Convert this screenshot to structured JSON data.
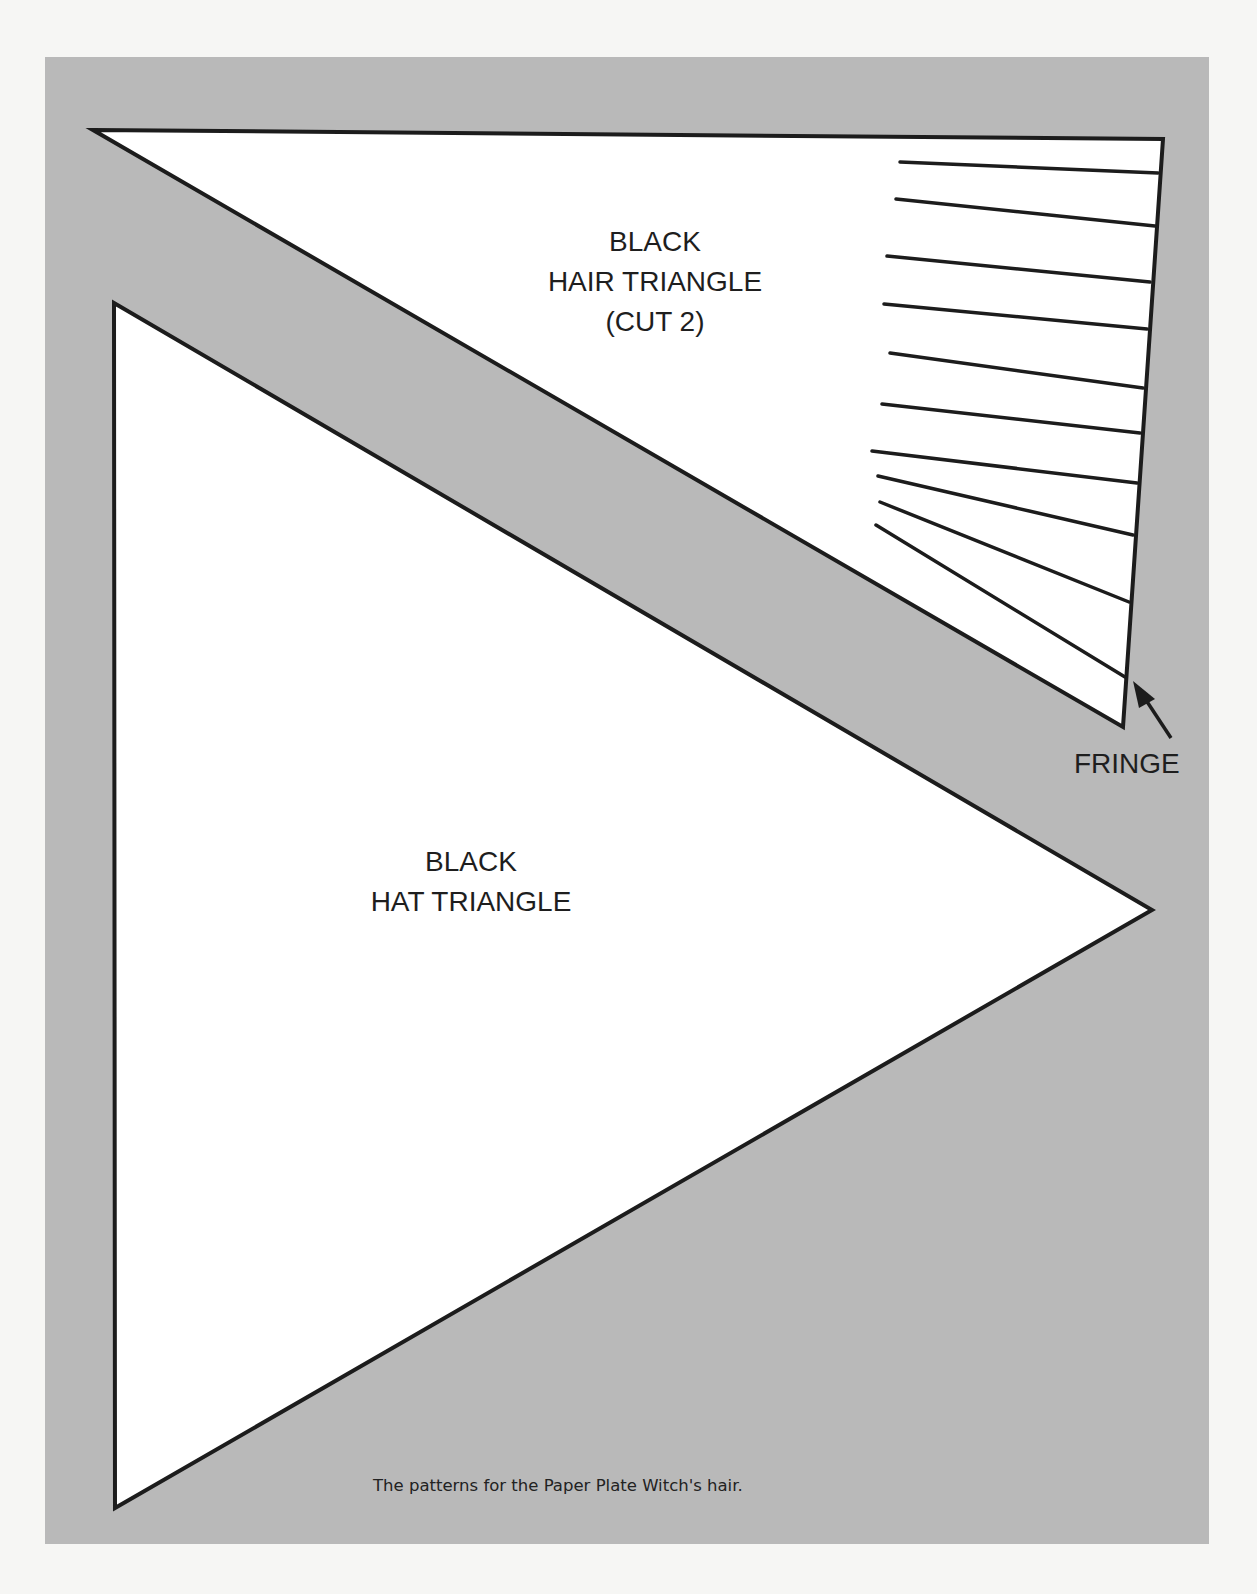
{
  "page": {
    "background_color": "#f6f6f4",
    "panel_color": "#b9b9b9",
    "line_color": "#1c1c1c"
  },
  "hair_triangle": {
    "label_lines": [
      "BLACK",
      "HAIR TRIANGLE",
      "(CUT 2)"
    ],
    "vertices": [
      [
        93,
        130
      ],
      [
        1163,
        139
      ],
      [
        1123,
        727
      ]
    ],
    "fringe_line_count": 10
  },
  "hat_triangle": {
    "label_lines": [
      "BLACK",
      "HAT TRIANGLE"
    ],
    "vertices": [
      [
        114,
        303
      ],
      [
        1152,
        910
      ],
      [
        115,
        1508
      ]
    ]
  },
  "fringe": {
    "label": "FRINGE",
    "arrow": "arrow pointing to fringe edge"
  },
  "caption": "The patterns for the Paper Plate Witch's hair."
}
